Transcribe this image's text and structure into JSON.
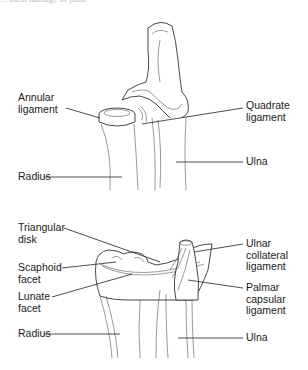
{
  "caption": {
    "partial_text": "... ment damage of joint"
  },
  "upper_figure": {
    "labels": [
      {
        "id": "annular-ligament",
        "text": "Annular\nligament"
      },
      {
        "id": "radius",
        "text": "Radius"
      },
      {
        "id": "quadrate-ligament",
        "text": "Quadrate\nligament"
      },
      {
        "id": "ulna",
        "text": "Ulna"
      }
    ]
  },
  "lower_figure": {
    "labels": [
      {
        "id": "triangular-disk",
        "text": "Triangular\ndisk"
      },
      {
        "id": "scaphoid-facet",
        "text": "Scaphoid\nfacet"
      },
      {
        "id": "lunate-facet",
        "text": "Lunate\nfacet"
      },
      {
        "id": "radius",
        "text": "Radius"
      },
      {
        "id": "ulnar-collateral-ligament",
        "text": "Ulnar\ncollateral\nligament"
      },
      {
        "id": "palmar-capsular-ligament",
        "text": "Palmar\ncapsular\nligament"
      },
      {
        "id": "ulna",
        "text": "Ulna"
      }
    ]
  },
  "colors": {
    "line": "#333333",
    "text": "#1a1a1a",
    "background": "#ffffff"
  }
}
